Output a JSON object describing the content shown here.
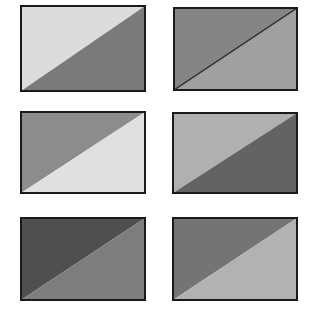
{
  "figure": {
    "background": "#ffffff",
    "border_color": "#1a1a1a",
    "border_width": 2,
    "panels": [
      {
        "id": "top-left",
        "x": 21,
        "y": 6,
        "w": 124,
        "h": 85,
        "upper_left_color": "#dcdcdc",
        "lower_right_color": "#7a7a7a",
        "diagonal_line": false
      },
      {
        "id": "top-right",
        "x": 174,
        "y": 8,
        "w": 123,
        "h": 82,
        "upper_left_color": "#858585",
        "lower_right_color": "#a0a0a0",
        "diagonal_line": true,
        "diagonal_line_color": "#2a2a2a"
      },
      {
        "id": "middle-left",
        "x": 21,
        "y": 112,
        "w": 124,
        "h": 81,
        "upper_left_color": "#8c8c8c",
        "lower_right_color": "#e0e0e0",
        "diagonal_line": false
      },
      {
        "id": "middle-right",
        "x": 173,
        "y": 113,
        "w": 124,
        "h": 80,
        "upper_left_color": "#b0b0b0",
        "lower_right_color": "#636363",
        "diagonal_line": false
      },
      {
        "id": "bottom-left",
        "x": 21,
        "y": 218,
        "w": 124,
        "h": 82,
        "upper_left_color": "#4f4f4f",
        "lower_right_color": "#7d7d7d",
        "diagonal_line": false
      },
      {
        "id": "bottom-right",
        "x": 173,
        "y": 218,
        "w": 124,
        "h": 82,
        "upper_left_color": "#747474",
        "lower_right_color": "#b2b2b2",
        "diagonal_line": false
      }
    ]
  }
}
